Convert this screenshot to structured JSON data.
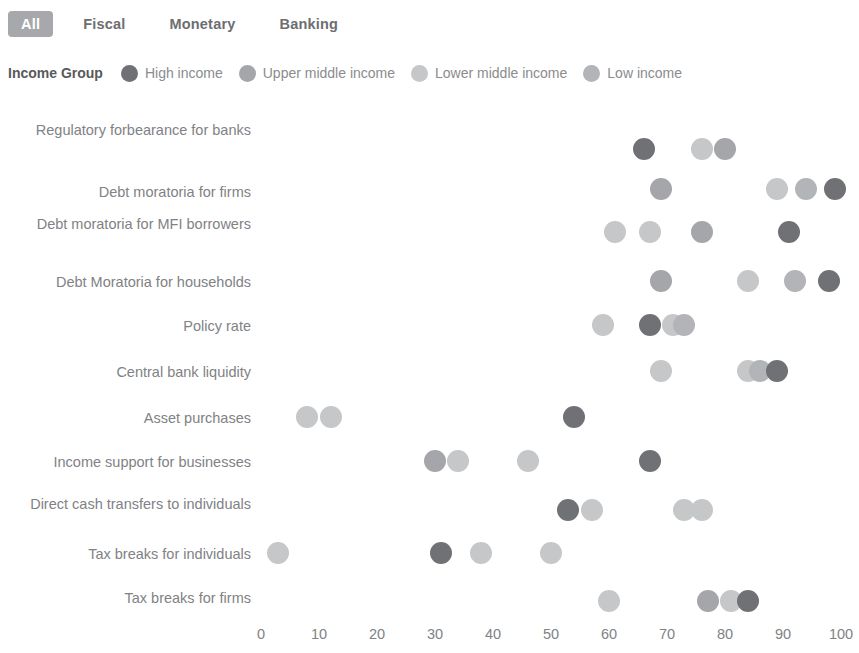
{
  "tabs": [
    {
      "label": "All",
      "active": true
    },
    {
      "label": "Fiscal",
      "active": false
    },
    {
      "label": "Monetary",
      "active": false
    },
    {
      "label": "Banking",
      "active": false
    }
  ],
  "legend": {
    "title": "Income Group",
    "items": [
      {
        "label": "High income",
        "color": "#6f7174"
      },
      {
        "label": "Upper middle income",
        "color": "#a4a6a9"
      },
      {
        "label": "Lower middle income",
        "color": "#c5c7c9"
      },
      {
        "label": "Low income",
        "color": "#b2b4b7"
      }
    ]
  },
  "colors": {
    "active_tab_bg": "#a6a8ab",
    "active_tab_text": "#ffffff",
    "text": "#808285",
    "background": "#ffffff"
  },
  "chart_data": {
    "type": "scatter",
    "title": "",
    "xlabel": "",
    "ylabel": "",
    "xlim": [
      0,
      100
    ],
    "grid": false,
    "legend_position": "top",
    "xticks": [
      0,
      10,
      20,
      30,
      40,
      50,
      60,
      70,
      80,
      90,
      100
    ],
    "series": [
      {
        "name": "High income",
        "color": "#6f7174"
      },
      {
        "name": "Upper middle income",
        "color": "#a4a6a9"
      },
      {
        "name": "Lower middle income",
        "color": "#c5c7c9"
      },
      {
        "name": "Low income",
        "color": "#b2b4b7"
      }
    ],
    "categories": [
      "Regulatory forbearance for banks",
      "Debt moratoria for firms",
      "Debt moratoria for MFI borrowers",
      "Debt Moratoria for households",
      "Policy rate",
      "Central bank liquidity",
      "Asset purchases",
      "Income support for businesses",
      "Direct cash transfers to individuals",
      "Tax breaks for individuals",
      "Tax breaks for firms"
    ],
    "rows": [
      {
        "category": "Regulatory forbearance for banks",
        "points": [
          {
            "group": "High income",
            "value": 66
          },
          {
            "group": "Lower middle income",
            "value": 76
          },
          {
            "group": "Upper middle income",
            "value": 80
          }
        ]
      },
      {
        "category": "Debt moratoria for firms",
        "points": [
          {
            "group": "Upper middle income",
            "value": 69
          },
          {
            "group": "Lower middle income",
            "value": 89
          },
          {
            "group": "Low income",
            "value": 94
          },
          {
            "group": "High income",
            "value": 99
          }
        ]
      },
      {
        "category": "Debt moratoria for MFI borrowers",
        "points": [
          {
            "group": "Lower middle income",
            "value": 61
          },
          {
            "group": "Lower middle income",
            "value": 67
          },
          {
            "group": "Upper middle income",
            "value": 76
          },
          {
            "group": "High income",
            "value": 91
          }
        ]
      },
      {
        "category": "Debt Moratoria for households",
        "points": [
          {
            "group": "Upper middle income",
            "value": 69
          },
          {
            "group": "Lower middle income",
            "value": 84
          },
          {
            "group": "Low income",
            "value": 92
          },
          {
            "group": "High income",
            "value": 98
          }
        ]
      },
      {
        "category": "Policy rate",
        "points": [
          {
            "group": "Lower middle income",
            "value": 59
          },
          {
            "group": "High income",
            "value": 67
          },
          {
            "group": "Lower middle income",
            "value": 71
          },
          {
            "group": "Low income",
            "value": 73
          }
        ]
      },
      {
        "category": "Central bank liquidity",
        "points": [
          {
            "group": "Lower middle income",
            "value": 69
          },
          {
            "group": "Lower middle income",
            "value": 84
          },
          {
            "group": "Low income",
            "value": 86
          },
          {
            "group": "High income",
            "value": 89
          }
        ]
      },
      {
        "category": "Asset purchases",
        "points": [
          {
            "group": "Lower middle income",
            "value": 8
          },
          {
            "group": "Lower middle income",
            "value": 12
          },
          {
            "group": "High income",
            "value": 54
          }
        ]
      },
      {
        "category": "Income support for businesses",
        "points": [
          {
            "group": "Upper middle income",
            "value": 30
          },
          {
            "group": "Lower middle income",
            "value": 34
          },
          {
            "group": "Lower middle income",
            "value": 46
          },
          {
            "group": "High income",
            "value": 67
          }
        ]
      },
      {
        "category": "Direct cash transfers to individuals",
        "points": [
          {
            "group": "High income",
            "value": 53
          },
          {
            "group": "Lower middle income",
            "value": 57
          },
          {
            "group": "Lower middle income",
            "value": 73
          },
          {
            "group": "Lower middle income",
            "value": 76
          }
        ]
      },
      {
        "category": "Tax breaks for individuals",
        "points": [
          {
            "group": "Lower middle income",
            "value": 3
          },
          {
            "group": "High income",
            "value": 31
          },
          {
            "group": "Lower middle income",
            "value": 38
          },
          {
            "group": "Lower middle income",
            "value": 50
          }
        ]
      },
      {
        "category": "Tax breaks for firms",
        "points": [
          {
            "group": "Lower middle income",
            "value": 60
          },
          {
            "group": "Upper middle income",
            "value": 77
          },
          {
            "group": "Lower middle income",
            "value": 81
          },
          {
            "group": "High income",
            "value": 84
          }
        ]
      }
    ]
  }
}
